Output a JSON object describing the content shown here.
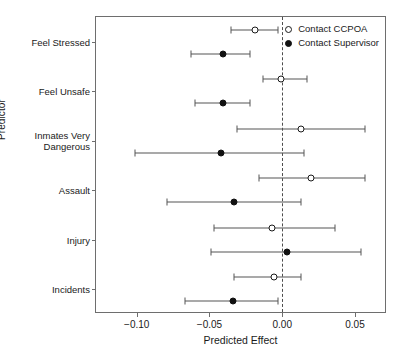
{
  "chart_data": {
    "type": "scatter",
    "title": "",
    "xlabel": "Predicted Effect",
    "ylabel": "Predictor",
    "xlim": [
      -0.128,
      0.072
    ],
    "xticks": [
      -0.1,
      -0.05,
      0.0,
      0.05
    ],
    "xticklabels": [
      "-0.10",
      "-0.05",
      "0.00",
      "0.05"
    ],
    "grid": false,
    "reference_line": 0.0,
    "legend_position": "top-right",
    "categories": [
      "Feel Stressed",
      "Feel Unsafe",
      "Inmates Very\nDangerous",
      "Assault",
      "Injury",
      "Incidents"
    ],
    "series": [
      {
        "name": "Contact CCPOA",
        "marker": "open-circle",
        "color": "#111111",
        "values": [
          -0.019,
          -0.001,
          0.013,
          0.02,
          -0.007,
          -0.006
        ],
        "ci_low": [
          -0.035,
          -0.013,
          -0.031,
          -0.016,
          -0.047,
          -0.033
        ],
        "ci_high": [
          -0.003,
          0.017,
          0.057,
          0.057,
          0.036,
          0.013
        ]
      },
      {
        "name": "Contact Supervisor",
        "marker": "filled-circle",
        "color": "#111111",
        "values": [
          -0.041,
          -0.041,
          -0.042,
          -0.033,
          0.003,
          -0.034
        ],
        "ci_low": [
          -0.063,
          -0.06,
          -0.101,
          -0.079,
          -0.049,
          -0.067
        ],
        "ci_high": [
          -0.022,
          -0.022,
          0.015,
          0.013,
          0.054,
          -0.003
        ]
      }
    ]
  },
  "legend": {
    "items": [
      {
        "label": "Contact CCPOA",
        "marker": "open-circle"
      },
      {
        "label": "Contact Supervisor",
        "marker": "filled-circle"
      }
    ]
  },
  "axes": {
    "x_label": "Predicted Effect",
    "y_label": "Predictor"
  }
}
